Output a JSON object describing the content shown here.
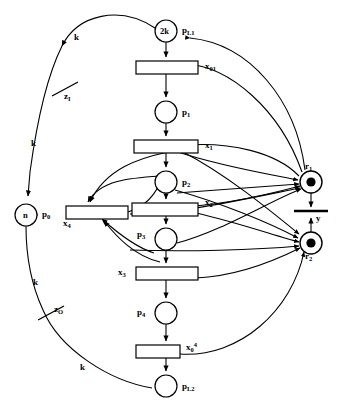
{
  "diagram": {
    "type": "petri-net",
    "stroke_color": "#000000",
    "fill_color": "#ffffff",
    "background": "#ffffff"
  },
  "places": [
    {
      "id": "pL1",
      "label": "p",
      "sublabel": "L1",
      "marking": "2k",
      "cx": 166,
      "cy": 31,
      "r": 11
    },
    {
      "id": "p1",
      "label": "p",
      "sublabel": "1",
      "marking": "",
      "cx": 166,
      "cy": 112,
      "r": 11
    },
    {
      "id": "p2",
      "label": "p",
      "sublabel": "2",
      "marking": "",
      "cx": 166,
      "cy": 182,
      "r": 11
    },
    {
      "id": "p3",
      "label": "p",
      "sublabel": "3",
      "marking": "",
      "cx": 166,
      "cy": 239,
      "r": 11
    },
    {
      "id": "p4",
      "label": "p",
      "sublabel": "4",
      "marking": "",
      "cx": 166,
      "cy": 313,
      "r": 11
    },
    {
      "id": "pL2",
      "label": "p",
      "sublabel": "L2",
      "marking": "",
      "cx": 166,
      "cy": 386,
      "r": 11
    },
    {
      "id": "p0",
      "label": "p",
      "sublabel": "0",
      "marking": "n",
      "cx": 26,
      "cy": 215,
      "r": 11
    },
    {
      "id": "r1",
      "label": "r",
      "sublabel": "1",
      "marking": "dot",
      "cx": 311,
      "cy": 182,
      "r": 11
    },
    {
      "id": "r2",
      "label": "r",
      "sublabel": "2",
      "marking": "dot",
      "cx": 311,
      "cy": 243,
      "r": 11
    }
  ],
  "transitions": [
    {
      "id": "x01",
      "label": "x",
      "sublabel": "01",
      "sup": "",
      "x": 136,
      "y": 61,
      "w": 62,
      "h": 13,
      "label_side": "right"
    },
    {
      "id": "x1",
      "label": "x",
      "sublabel": "1",
      "sup": "",
      "x": 134,
      "y": 140,
      "w": 64,
      "h": 13,
      "label_side": "right"
    },
    {
      "id": "x2",
      "label": "x",
      "sublabel": "2",
      "sup": "",
      "x": 132,
      "y": 203,
      "w": 66,
      "h": 13,
      "label_side": "right"
    },
    {
      "id": "x3",
      "label": "x",
      "sublabel": "3",
      "sup": "",
      "x": 136,
      "y": 267,
      "w": 62,
      "h": 13,
      "label_side": "left"
    },
    {
      "id": "x4",
      "label": "x",
      "sublabel": "4",
      "sup": "",
      "x": 66,
      "y": 206,
      "w": 62,
      "h": 13,
      "label_side": "below-left"
    },
    {
      "id": "x04",
      "label": "x",
      "sublabel": "0",
      "sup": "4",
      "x": 136,
      "y": 345,
      "w": 44,
      "h": 13,
      "label_side": "right"
    },
    {
      "id": "y",
      "label": "y",
      "sublabel": "",
      "sup": "",
      "x": 294,
      "y": 210,
      "w": 34,
      "h": 2,
      "label_side": "bar-right"
    },
    {
      "id": "zI",
      "label": "z",
      "sublabel": "I",
      "sup": "",
      "x": 52,
      "y": 88,
      "w": 26,
      "h": 2,
      "label_side": "bar-right"
    },
    {
      "id": "zO",
      "label": "z",
      "sublabel": "O",
      "sup": "",
      "x": 38,
      "y": 312,
      "w": 26,
      "h": 2,
      "label_side": "bar-right"
    }
  ],
  "arc_weights": [
    {
      "id": "w_k_top",
      "text": "k",
      "x": 74,
      "y": 33
    },
    {
      "id": "w_k_upmid",
      "text": "k",
      "x": 31,
      "y": 139
    },
    {
      "id": "w_k_lowmid",
      "text": "k",
      "x": 33,
      "y": 278
    },
    {
      "id": "w_k_bottom",
      "text": "k",
      "x": 80,
      "y": 363
    }
  ],
  "markings": {
    "pL1_tokens": "2k",
    "p0_tokens": "n",
    "r1_tokens": "●",
    "r2_tokens": "●"
  }
}
